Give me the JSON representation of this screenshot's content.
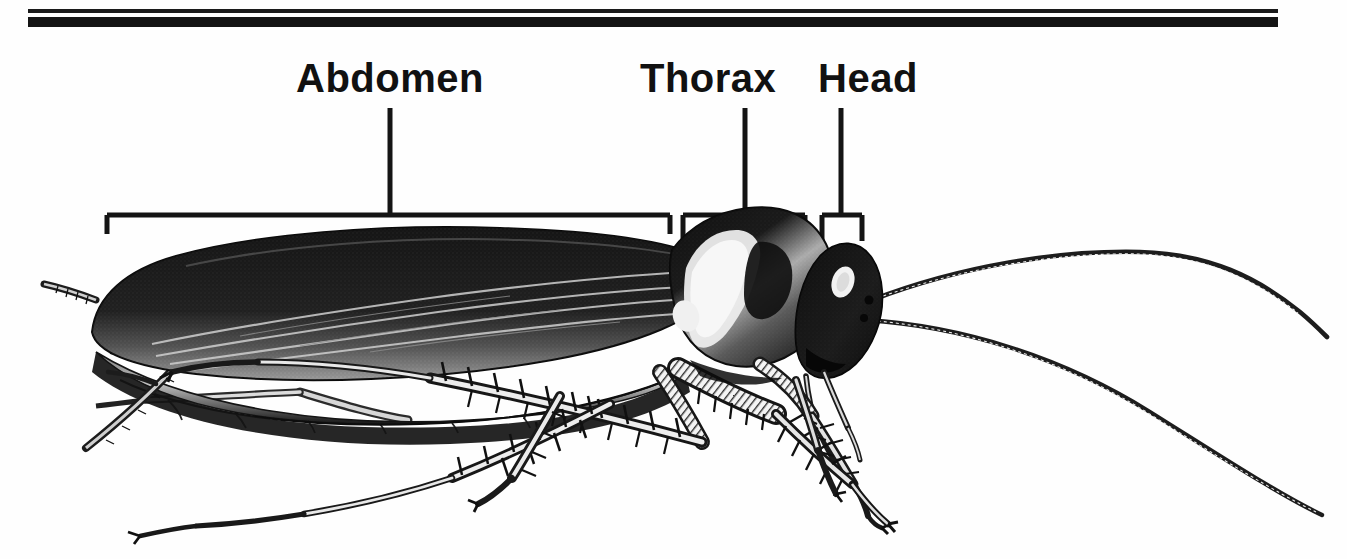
{
  "figure": {
    "kind": "anatomical-illustration",
    "view": "lateral",
    "background_color": "#fefefe",
    "ink_color": "#111111",
    "width": 1347,
    "height": 559
  },
  "rules": {
    "thin": {
      "x": 28,
      "y": 9,
      "width": 1250,
      "height": 4,
      "color": "#1a1a1a"
    },
    "thick": {
      "x": 28,
      "y": 17,
      "width": 1250,
      "height": 10,
      "color": "#141414"
    }
  },
  "labels": [
    {
      "id": "abdomen",
      "text": "Abdomen",
      "x": 296,
      "y": 58,
      "leader_x": 390,
      "leader_top": 107,
      "bracket": {
        "left": 105,
        "right": 672,
        "y": 213,
        "tick": 20
      }
    },
    {
      "id": "thorax",
      "text": "Thorax",
      "x": 640,
      "y": 58,
      "leader_x": 745,
      "leader_top": 107,
      "bracket": {
        "left": 681,
        "right": 807,
        "y": 213,
        "tick": 26
      }
    },
    {
      "id": "head",
      "text": "Head",
      "x": 818,
      "y": 58,
      "leader_x": 841,
      "leader_top": 107,
      "bracket": {
        "left": 820,
        "right": 864,
        "y": 213,
        "tick": 26
      }
    }
  ],
  "anatomy": {
    "body_parts": [
      "tegmina-forewing",
      "abdomen-segments",
      "cerci",
      "pronotum",
      "head-capsule",
      "compound-eye",
      "antenna-left",
      "antenna-right",
      "maxillary-palps",
      "foreleg",
      "midleg",
      "hindleg"
    ],
    "antennae_count": 2,
    "legs_count": 6,
    "cerci_count": 2
  }
}
